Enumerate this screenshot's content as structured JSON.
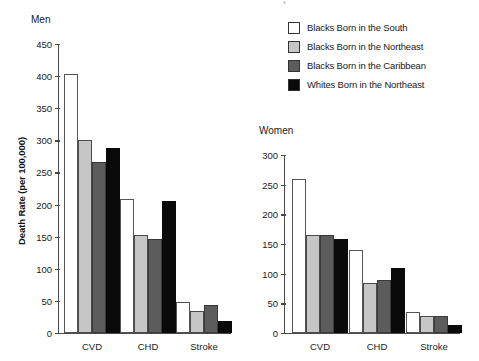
{
  "legend": {
    "items": [
      {
        "label": "Blacks Born in the South",
        "color": "#ffffff",
        "name": "legend-blacks-south"
      },
      {
        "label": "Blacks Born in the Northeast",
        "color": "#c6c6c6",
        "name": "legend-blacks-northeast"
      },
      {
        "label": "Blacks Born in the Caribbean",
        "color": "#5c5c5c",
        "name": "legend-blacks-caribbean"
      },
      {
        "label": "Whites Born in the Northeast",
        "color": "#0a0a0a",
        "name": "legend-whites-northeast"
      }
    ]
  },
  "axis_title": "Death Rate (per 100,000)",
  "panels": [
    {
      "title": "Men",
      "yticks": [
        "0",
        "50",
        "100",
        "150",
        "200",
        "250",
        "300",
        "350",
        "400",
        "450"
      ],
      "categories": [
        "CVD",
        "CHD",
        "Stroke"
      ]
    },
    {
      "title": "Women",
      "yticks": [
        "0",
        "50",
        "100",
        "150",
        "200",
        "250",
        "300"
      ],
      "categories": [
        "CVD",
        "CHD",
        "Stroke"
      ]
    }
  ],
  "chart_data": [
    {
      "type": "bar",
      "title": "Men",
      "xlabel": "",
      "ylabel": "Death Rate (per 100,000)",
      "ylim": [
        0,
        450
      ],
      "ytick_step": 50,
      "grid": false,
      "legend_position": "top-right",
      "categories": [
        "CVD",
        "CHD",
        "Stroke"
      ],
      "series": [
        {
          "name": "Blacks Born in the South",
          "color": "#ffffff",
          "values": [
            403,
            209,
            48
          ]
        },
        {
          "name": "Blacks Born in the Northeast",
          "color": "#c6c6c6",
          "values": [
            300,
            152,
            35
          ]
        },
        {
          "name": "Blacks Born in the Caribbean",
          "color": "#5c5c5c",
          "values": [
            267,
            147,
            44
          ]
        },
        {
          "name": "Whites Born in the Northeast",
          "color": "#0a0a0a",
          "values": [
            288,
            205,
            19
          ]
        }
      ]
    },
    {
      "type": "bar",
      "title": "Women",
      "xlabel": "",
      "ylabel": "",
      "ylim": [
        0,
        300
      ],
      "ytick_step": 50,
      "grid": false,
      "legend_position": "top-right",
      "categories": [
        "CVD",
        "CHD",
        "Stroke"
      ],
      "series": [
        {
          "name": "Blacks Born in the South",
          "color": "#ffffff",
          "values": [
            259,
            140,
            35
          ]
        },
        {
          "name": "Blacks Born in the Northeast",
          "color": "#c6c6c6",
          "values": [
            166,
            84,
            29
          ]
        },
        {
          "name": "Blacks Born in the Caribbean",
          "color": "#5c5c5c",
          "values": [
            166,
            89,
            29
          ]
        },
        {
          "name": "Whites Born in the Northeast",
          "color": "#0a0a0a",
          "values": [
            159,
            110,
            14
          ]
        }
      ]
    }
  ]
}
